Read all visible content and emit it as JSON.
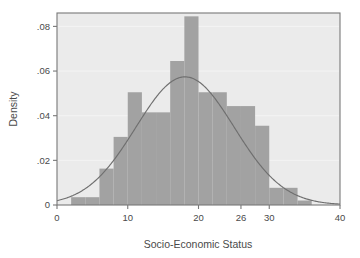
{
  "chart_data": {
    "type": "bar",
    "title": "",
    "subtitle": "",
    "xlabel": "Socio-Economic Status",
    "ylabel": "Density",
    "xlim": [
      0,
      40
    ],
    "ylim": [
      0,
      0.086
    ],
    "xticks": [
      0,
      10,
      20,
      26,
      30,
      40
    ],
    "xtick_labels": [
      "0",
      "10",
      "20",
      "26",
      "30",
      "40"
    ],
    "yticks": [
      0,
      0.02,
      0.04,
      0.06,
      0.08
    ],
    "ytick_labels": [
      "0",
      ".02",
      ".04",
      ".06",
      ".08"
    ],
    "grid": "horizontal",
    "legend": "none",
    "bin_width": 2,
    "bin_starts": [
      0,
      2,
      4,
      6,
      8,
      10,
      12,
      14,
      16,
      18,
      20,
      22,
      24,
      26,
      28,
      30,
      32,
      34
    ],
    "categories": [
      "0-2",
      "2-4",
      "4-6",
      "6-8",
      "8-10",
      "10-12",
      "12-14",
      "14-16",
      "16-18",
      "18-20",
      "20-22",
      "22-24",
      "24-26",
      "26-28",
      "28-30",
      "30-32",
      "32-34",
      "34-36"
    ],
    "values": [
      0.0,
      0.0035,
      0.0035,
      0.0163,
      0.0305,
      0.0505,
      0.0415,
      0.0415,
      0.0645,
      0.0845,
      0.0505,
      0.0505,
      0.0443,
      0.0443,
      0.0355,
      0.0077,
      0.0077,
      0.002
    ],
    "series": [
      {
        "name": "Density histogram",
        "type": "bar",
        "color": "#a2a2a2",
        "values": [
          0.0,
          0.0035,
          0.0035,
          0.0163,
          0.0305,
          0.0505,
          0.0415,
          0.0415,
          0.0645,
          0.0845,
          0.0505,
          0.0505,
          0.0443,
          0.0443,
          0.0355,
          0.0077,
          0.0077,
          0.002
        ]
      },
      {
        "name": "Normal density curve",
        "type": "line",
        "color": "#6f6f6f",
        "distribution": "normal",
        "mean": 18.1,
        "sd": 6.95,
        "peak": 0.0575
      }
    ],
    "plot_background": "#ebebeb",
    "page_background": "#ffffff",
    "frame_color": "#787878",
    "gridline_color": "#f5f5f5"
  }
}
